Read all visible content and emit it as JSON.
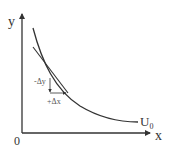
{
  "diagram": {
    "type": "indifference-curve",
    "axes": {
      "x_label": "x",
      "y_label": "y",
      "origin_label": "0"
    },
    "curve_label": "U",
    "curve_label_subscript": "0",
    "annotations": {
      "delta_y": "-Δy",
      "delta_x": "+Δx"
    },
    "colors": {
      "line": "#333333",
      "text": "#333333"
    }
  }
}
